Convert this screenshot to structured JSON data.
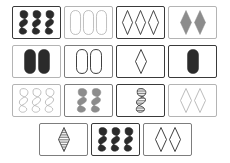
{
  "game": {
    "name": "SET card game board",
    "board_size": "230x163",
    "rows": 4,
    "total_cards": 15,
    "palette": {
      "solid_dark": "#2b2b2b",
      "solid_gray": "#8c8c8c",
      "outline_dark": "#2b2b2b",
      "outline_light": "#b4b4b4",
      "card_border_dark": "#3a3a3a",
      "card_border_light": "#b4b4b4",
      "background": "#ffffff"
    },
    "rows_data": [
      {
        "row_index": 0,
        "cards": [
          {
            "id": "card-1",
            "count": 3,
            "shape": "squiggle",
            "shading": "solid",
            "color": "#2b2b2b",
            "border": "dark"
          },
          {
            "id": "card-2",
            "count": 3,
            "shape": "oval",
            "shading": "outline",
            "color": "#b4b4b4",
            "border": "light"
          },
          {
            "id": "card-3",
            "count": 3,
            "shape": "diamond",
            "shading": "outline",
            "color": "#2b2b2b",
            "border": "dark"
          },
          {
            "id": "card-4",
            "count": 2,
            "shape": "diamond",
            "shading": "solid",
            "color": "#8c8c8c",
            "border": "light"
          }
        ]
      },
      {
        "row_index": 1,
        "cards": [
          {
            "id": "card-5",
            "count": 2,
            "shape": "oval",
            "shading": "solid",
            "color": "#2b2b2b",
            "border": "light"
          },
          {
            "id": "card-6",
            "count": 2,
            "shape": "oval",
            "shading": "outline",
            "color": "#2b2b2b",
            "border": "mid"
          },
          {
            "id": "card-7",
            "count": 1,
            "shape": "diamond",
            "shading": "outline",
            "color": "#2b2b2b",
            "border": "dark"
          },
          {
            "id": "card-8",
            "count": 1,
            "shape": "oval",
            "shading": "solid",
            "color": "#2b2b2b",
            "border": "dark"
          }
        ]
      },
      {
        "row_index": 2,
        "cards": [
          {
            "id": "card-9",
            "count": 3,
            "shape": "squiggle",
            "shading": "outline",
            "color": "#b4b4b4",
            "border": "light"
          },
          {
            "id": "card-10",
            "count": 2,
            "shape": "squiggle",
            "shading": "solid",
            "color": "#8c8c8c",
            "border": "mid"
          },
          {
            "id": "card-11",
            "count": 1,
            "shape": "squiggle",
            "shading": "striped",
            "color": "#2b2b2b",
            "border": "dark"
          },
          {
            "id": "card-12",
            "count": 2,
            "shape": "diamond",
            "shading": "outline",
            "color": "#b4b4b4",
            "border": "light"
          }
        ]
      },
      {
        "row_index": 3,
        "cards": [
          {
            "id": "card-13",
            "count": 1,
            "shape": "diamond",
            "shading": "striped",
            "color": "#2b2b2b",
            "border": "mid"
          },
          {
            "id": "card-14",
            "count": 3,
            "shape": "squiggle",
            "shading": "solid",
            "color": "#2b2b2b",
            "border": "dark"
          },
          {
            "id": "card-15",
            "count": 2,
            "shape": "diamond",
            "shading": "outline",
            "color": "#2b2b2b",
            "border": "mid"
          }
        ]
      }
    ]
  }
}
